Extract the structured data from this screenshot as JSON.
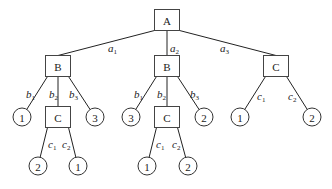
{
  "diagram": {
    "nodes": [
      {
        "id": "A",
        "type": "box",
        "label": "A",
        "x": 167,
        "y": 20
      },
      {
        "id": "B1",
        "type": "box",
        "label": "B",
        "x": 58,
        "y": 66
      },
      {
        "id": "B2",
        "type": "box",
        "label": "B",
        "x": 167,
        "y": 66
      },
      {
        "id": "C3",
        "type": "box",
        "label": "C",
        "x": 276,
        "y": 66
      },
      {
        "id": "L1",
        "type": "circle",
        "label": "1",
        "x": 22,
        "y": 117
      },
      {
        "id": "C1",
        "type": "box",
        "label": "C",
        "x": 58,
        "y": 117
      },
      {
        "id": "L3",
        "type": "circle",
        "label": "3",
        "x": 95,
        "y": 117
      },
      {
        "id": "L4",
        "type": "circle",
        "label": "3",
        "x": 131,
        "y": 117
      },
      {
        "id": "C2",
        "type": "box",
        "label": "C",
        "x": 167,
        "y": 117
      },
      {
        "id": "L6",
        "type": "circle",
        "label": "2",
        "x": 204,
        "y": 117
      },
      {
        "id": "L7",
        "type": "circle",
        "label": "1",
        "x": 240,
        "y": 117
      },
      {
        "id": "L8",
        "type": "circle",
        "label": "2",
        "x": 312,
        "y": 117
      },
      {
        "id": "L9",
        "type": "circle",
        "label": "2",
        "x": 38,
        "y": 166
      },
      {
        "id": "L10",
        "type": "circle",
        "label": "1",
        "x": 78,
        "y": 166
      },
      {
        "id": "L11",
        "type": "circle",
        "label": "1",
        "x": 147,
        "y": 166
      },
      {
        "id": "L12",
        "type": "circle",
        "label": "2",
        "x": 188,
        "y": 166
      }
    ],
    "edges": [
      {
        "from": "A",
        "to": "B1",
        "label": "a",
        "sub": "1",
        "lx": 108,
        "ly": 52
      },
      {
        "from": "A",
        "to": "B2",
        "label": "a",
        "sub": "2",
        "lx": 170,
        "ly": 52
      },
      {
        "from": "A",
        "to": "C3",
        "label": "a",
        "sub": "3",
        "lx": 220,
        "ly": 52
      },
      {
        "from": "B1",
        "to": "L1",
        "label": "b",
        "sub": "1",
        "lx": 26,
        "ly": 98
      },
      {
        "from": "B1",
        "to": "C1",
        "label": "b",
        "sub": "2",
        "lx": 49,
        "ly": 98
      },
      {
        "from": "B1",
        "to": "L3",
        "label": "b",
        "sub": "3",
        "lx": 69,
        "ly": 98
      },
      {
        "from": "B2",
        "to": "L4",
        "label": "b",
        "sub": "1",
        "lx": 134,
        "ly": 98
      },
      {
        "from": "B2",
        "to": "C2",
        "label": "b",
        "sub": "2",
        "lx": 157,
        "ly": 98
      },
      {
        "from": "B2",
        "to": "L6",
        "label": "b",
        "sub": "3",
        "lx": 190,
        "ly": 98
      },
      {
        "from": "C3",
        "to": "L7",
        "label": "c",
        "sub": "1",
        "lx": 257,
        "ly": 100
      },
      {
        "from": "C3",
        "to": "L8",
        "label": "c",
        "sub": "2",
        "lx": 288,
        "ly": 100
      },
      {
        "from": "C1",
        "to": "L9",
        "label": "c",
        "sub": "1",
        "lx": 48,
        "ly": 148
      },
      {
        "from": "C1",
        "to": "L10",
        "label": "c",
        "sub": "2",
        "lx": 62,
        "ly": 148
      },
      {
        "from": "C2",
        "to": "L11",
        "label": "c",
        "sub": "1",
        "lx": 156,
        "ly": 148
      },
      {
        "from": "C2",
        "to": "L12",
        "label": "c",
        "sub": "2",
        "lx": 172,
        "ly": 148
      }
    ],
    "box_size": {
      "w": 25,
      "h": 21
    },
    "circle_radius": 9
  }
}
